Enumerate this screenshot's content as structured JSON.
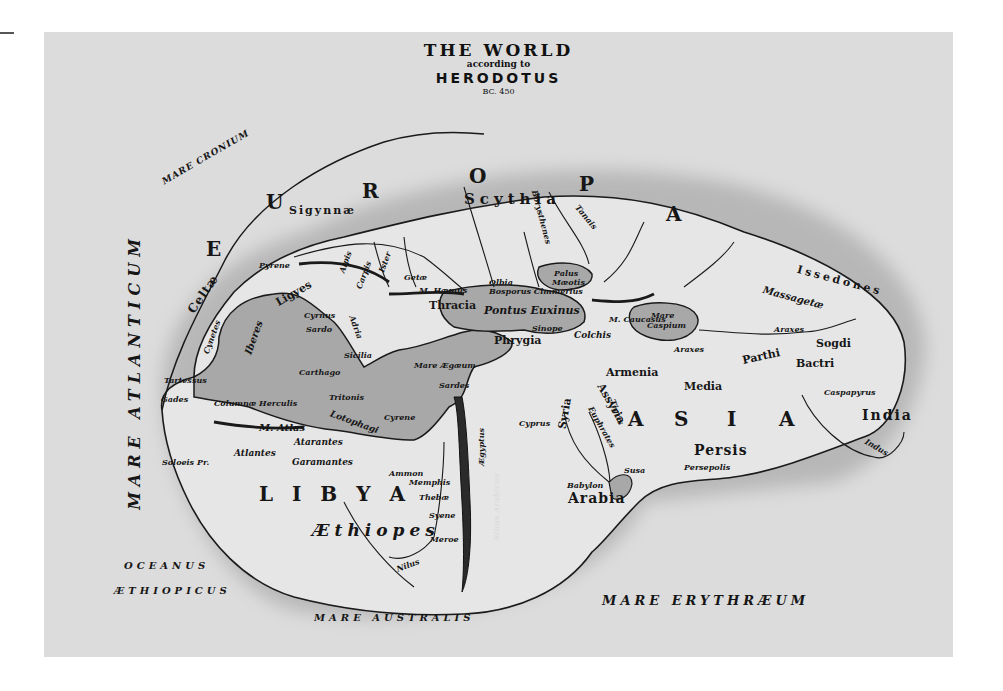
{
  "title": {
    "line1": "THE WORLD",
    "line2": "according to",
    "line3": "HERODOTUS",
    "line4": "BC. 450"
  },
  "colors": {
    "paper": "#dcdcdc",
    "land": "#e4e4e4",
    "water_inland": "#a9a9a9",
    "ink": "#161616",
    "coast_shadow": "#8c8c8c"
  },
  "continents": {
    "europa_letters": [
      "E",
      "U",
      "R",
      "O",
      "P",
      "A"
    ],
    "asia_letters": [
      "A",
      "S",
      "I",
      "A"
    ],
    "libya": "L I B Y A"
  },
  "seas": {
    "atlanticum": "MARE ATLANTICUM",
    "cronium": "MARE CRONIUM",
    "oceanus_1": "OCEANUS",
    "oceanus_2": "ÆTHIOPICUS",
    "australis": "MARE AUSTRALIS",
    "erythraeum": "MARE ERYTHRÆUM",
    "pontus": "Pontus Euxinus",
    "caspium_1": "Mare",
    "caspium_2": "Caspium",
    "maeotis_1": "Palus",
    "maeotis_2": "Mæotis",
    "aegean": "Mare Ægæum"
  },
  "regions": {
    "scythia": "Scythia",
    "sigynnae": "Sigynnæ",
    "celtae": "Celtæ",
    "cynetes": "Cynetes",
    "iberes": "Iberes",
    "ligyes": "Ligyes",
    "thracia": "Thracia",
    "phrygia": "Phrygia",
    "colchis": "Colchis",
    "armenia": "Armenia",
    "assyria": "Assyria",
    "syria": "Syria",
    "media": "Media",
    "persis": "Persis",
    "parthi": "Parthi",
    "bactri": "Bactri",
    "sogdi": "Sogdi",
    "massagetae": "Massagetæ",
    "issedones": "Issedones",
    "india": "India",
    "arabia": "Arabia",
    "aethiopes": "Æthiopes",
    "atlantes": "Atlantes",
    "atarantes": "Atarantes",
    "garamantes": "Garamantes",
    "lotophagi": "Lotophagi",
    "aegyptus": "Ægyptus",
    "getae": "Getæ",
    "enetri": "Eneti",
    "gesatae": "Getæ"
  },
  "places": {
    "tartessus": "Tartessus",
    "gades": "Gades",
    "carthago": "Carthago",
    "cyrnus": "Cyrnus",
    "sardo": "Sardo",
    "sicilia": "Sicilia",
    "sardes": "Sardes",
    "cyprus": "Cyprus",
    "memphis": "Memphis",
    "thebae": "Thebæ",
    "syene": "Syene",
    "meroe": "Meroe",
    "ammon": "Ammon",
    "babylon": "Babylon",
    "susa": "Susa",
    "persepolis": "Persepolis",
    "caspapyrus": "Caspapyrus",
    "soloeis": "Soloeis Pr.",
    "m_atlas": "M. Atlas",
    "m_haemus": "M. Hæmus",
    "caucasus": "M. Caucasus",
    "sinope": "Sinope",
    "cyrene": "Cyrene",
    "pyrene": "Pyrene",
    "columnae": "Columnæ Herculis",
    "bosporus": "Bosporus Cimmerius",
    "olbia": "Olbia",
    "tritonis": "Tritonis"
  },
  "rivers": {
    "tanais": "Tanais",
    "borysthenes": "Borysthenes",
    "araxes_n": "Araxes",
    "araxes_s": "Araxes",
    "indus": "Indus",
    "nilus": "Nilus",
    "euphrates": "Euphrates",
    "tigris": "Tigris",
    "ister": "Ister",
    "alpis": "Alpis",
    "carpis": "Carpis",
    "salmydessus": "Salmydessus",
    "adria": "Adria",
    "sinus_arabicus": "Sinus Arabicus"
  }
}
